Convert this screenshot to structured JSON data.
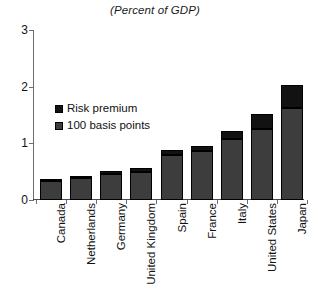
{
  "chart_data": {
    "type": "bar",
    "title": "(Percent of GDP)",
    "subtitle": "",
    "xlabel": "",
    "ylabel": "",
    "ylim": [
      0,
      3
    ],
    "yticks": [
      0,
      1,
      2,
      3
    ],
    "ytick_labels": [
      "0",
      "1",
      "2",
      "3"
    ],
    "grid": false,
    "stacked": true,
    "legend_position": "inside-upper-left",
    "categories": [
      "Canada",
      "Netherlands",
      "Germany",
      "United Kingdom",
      "Spain",
      "France",
      "Italy",
      "United States",
      "Japan"
    ],
    "series": [
      {
        "name": "100 basis points",
        "color": "#3d3d3d",
        "values": [
          0.33,
          0.38,
          0.46,
          0.5,
          0.8,
          0.87,
          1.07,
          1.26,
          1.63
        ]
      },
      {
        "name": "Risk premium",
        "color": "#121212",
        "values": [
          0.03,
          0.04,
          0.05,
          0.06,
          0.08,
          0.09,
          0.14,
          0.25,
          0.4
        ]
      }
    ],
    "totals": [
      0.36,
      0.42,
      0.51,
      0.56,
      0.88,
      0.96,
      1.21,
      1.51,
      2.03
    ]
  },
  "legend": {
    "items": [
      {
        "label": "Risk premium",
        "swatch": "risk-premium-swatch"
      },
      {
        "label": "100 basis points",
        "swatch": "basis-points-swatch"
      }
    ]
  }
}
